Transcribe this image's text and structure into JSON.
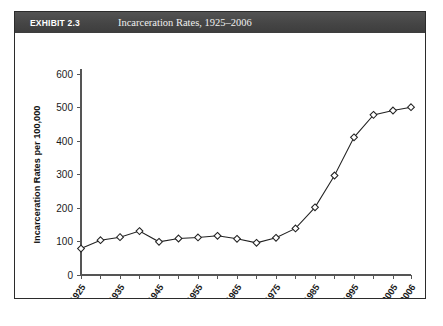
{
  "exhibit": {
    "number_label": "EXHIBIT 2.3",
    "title": "Incarceration Rates, 1925–2006",
    "header_bg": "#4a4a4a",
    "header_text_color": "#ffffff",
    "frame_border_color": "#2b2b2b",
    "page_bg": "#ffffff"
  },
  "chart_data": {
    "type": "line",
    "title": "Incarceration Rates, 1925–2006",
    "xlabel": "",
    "ylabel": "Incarceration Rates per 100,000",
    "ylim": [
      0,
      600
    ],
    "ytick_values": [
      0,
      100,
      200,
      300,
      400,
      500,
      600
    ],
    "ytick_labels": [
      "0",
      "100",
      "200",
      "300",
      "400",
      "500",
      "600"
    ],
    "xtick_labels": [
      "1925",
      "1935",
      "1945",
      "1955",
      "1965",
      "1975",
      "1985",
      "1995",
      "2005",
      "2006"
    ],
    "x": [
      1925,
      1930,
      1935,
      1940,
      1945,
      1950,
      1955,
      1960,
      1965,
      1970,
      1975,
      1980,
      1985,
      1990,
      1995,
      2000,
      2005,
      2006
    ],
    "values": [
      79,
      104,
      113,
      131,
      99,
      109,
      112,
      117,
      108,
      96,
      111,
      139,
      202,
      297,
      411,
      478,
      491,
      501
    ],
    "series": [
      {
        "name": "Incarceration Rate",
        "values": [
          79,
          104,
          113,
          131,
          99,
          109,
          112,
          117,
          108,
          96,
          111,
          139,
          202,
          297,
          411,
          478,
          491,
          501
        ]
      }
    ],
    "grid": false,
    "legend": false,
    "marker": "diamond",
    "line_color": "#222222",
    "marker_fill": "#ffffff"
  }
}
